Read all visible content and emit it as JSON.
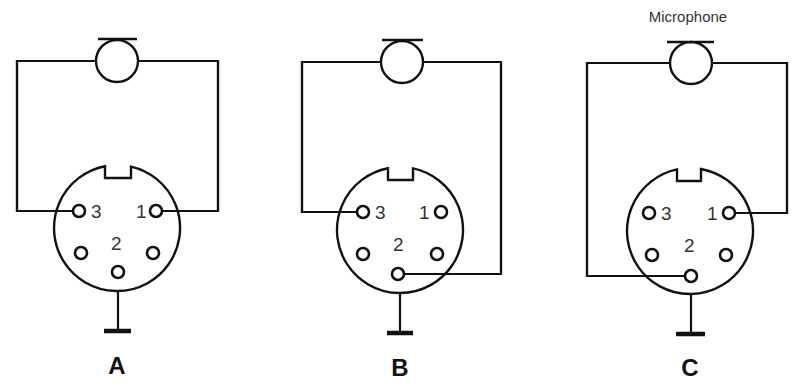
{
  "caption": "Microphone",
  "colors": {
    "line": "#111111",
    "text": "#333333",
    "background": "#ffffff"
  },
  "diagrams": [
    {
      "id": "A",
      "label": "A",
      "label_pos": [
        117,
        374
      ],
      "mic": {
        "cx": 117,
        "cy": 61,
        "r": 21,
        "bar_y": 39,
        "bar_x1": 98,
        "bar_x2": 137
      },
      "connector": {
        "cx": 117,
        "cy": 228,
        "r": 63,
        "notch_x1": 105,
        "notch_x2": 131,
        "notch_top": 163,
        "notch_bottom": 178
      },
      "pins": [
        {
          "name": "3",
          "cx": 79,
          "cy": 211
        },
        {
          "name": "1",
          "cx": 156,
          "cy": 211
        },
        {
          "name": "lower-left",
          "cx": 81,
          "cy": 253
        },
        {
          "name": "lower-right",
          "cx": 153,
          "cy": 253
        },
        {
          "name": "2",
          "cx": 118,
          "cy": 272
        }
      ],
      "pin_labels": [
        {
          "text": "3",
          "x": 91,
          "y": 218
        },
        {
          "text": "1",
          "x": 136,
          "y": 218
        },
        {
          "text": "2",
          "x": 111,
          "y": 250
        }
      ],
      "wires": [
        "M96,61 L17,61 L17,211 L73,211",
        "M138,61 L218,61 L218,211 L162,211",
        "M118,278 L118,331"
      ],
      "ground": {
        "x1": 104,
        "x2": 131,
        "y": 331
      },
      "connection": "Mic across pins 3 and 1; pin 2 grounded"
    },
    {
      "id": "B",
      "label": "B",
      "label_pos": [
        400,
        376
      ],
      "mic": {
        "cx": 402,
        "cy": 62,
        "r": 21,
        "bar_y": 40,
        "bar_x1": 382,
        "bar_x2": 423
      },
      "connector": {
        "cx": 400,
        "cy": 230,
        "r": 63,
        "notch_x1": 388,
        "notch_x2": 413,
        "notch_top": 165,
        "notch_bottom": 180
      },
      "pins": [
        {
          "name": "3",
          "cx": 363,
          "cy": 212
        },
        {
          "name": "1",
          "cx": 441,
          "cy": 212
        },
        {
          "name": "lower-left",
          "cx": 363,
          "cy": 254
        },
        {
          "name": "lower-right",
          "cx": 437,
          "cy": 254
        },
        {
          "name": "2",
          "cx": 398,
          "cy": 274
        }
      ],
      "pin_labels": [
        {
          "text": "3",
          "x": 375,
          "y": 219
        },
        {
          "text": "1",
          "x": 419,
          "y": 219
        },
        {
          "text": "2",
          "x": 393,
          "y": 251
        }
      ],
      "wires": [
        "M381,62 L302,62 L302,212 L357,212",
        "M423,62 L501,62 L501,274 L404,274",
        "M400,293 L400,333"
      ],
      "ground": {
        "x1": 387,
        "x2": 413,
        "y": 333
      },
      "connection": "Mic across pins 3 and 2; pin 2 side grounded"
    },
    {
      "id": "C",
      "label": "C",
      "label_pos": [
        690,
        376
      ],
      "mic": {
        "cx": 691,
        "cy": 63,
        "r": 21,
        "bar_y": 42,
        "bar_x1": 667,
        "bar_x2": 714
      },
      "connector": {
        "cx": 690,
        "cy": 231,
        "r": 63,
        "notch_x1": 677,
        "notch_x2": 701,
        "notch_top": 166,
        "notch_bottom": 181
      },
      "pins": [
        {
          "name": "3",
          "cx": 649,
          "cy": 213
        },
        {
          "name": "1",
          "cx": 729,
          "cy": 213
        },
        {
          "name": "lower-left",
          "cx": 652,
          "cy": 255
        },
        {
          "name": "lower-right",
          "cx": 726,
          "cy": 255
        },
        {
          "name": "2",
          "cx": 691,
          "cy": 276
        }
      ],
      "pin_labels": [
        {
          "text": "3",
          "x": 661,
          "y": 220
        },
        {
          "text": "1",
          "x": 707,
          "y": 220
        },
        {
          "text": "2",
          "x": 684,
          "y": 252
        }
      ],
      "wires": [
        "M670,63 L587,63 L587,276 L685,276",
        "M712,63 L787,63 L787,213 L735,213",
        "M691,294 L691,334"
      ],
      "ground": {
        "x1": 676,
        "x2": 705,
        "y": 334
      },
      "connection": "Mic across pins 2 and 1; pin 2 grounded"
    }
  ],
  "caption_pos": [
    688,
    22
  ]
}
